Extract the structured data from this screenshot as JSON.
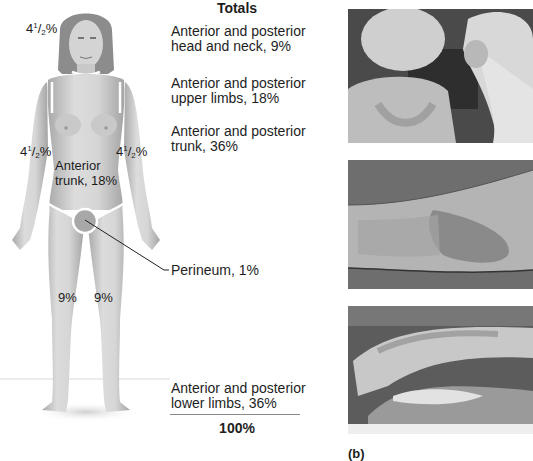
{
  "figure": {
    "labels": {
      "head_whole": "4",
      "head_num": "1",
      "head_den": "2",
      "head_pct": "%",
      "left_arm_whole": "4",
      "left_arm_num": "1",
      "left_arm_den": "2",
      "left_arm_pct": "%",
      "right_arm_whole": "4",
      "right_arm_num": "1",
      "right_arm_den": "2",
      "right_arm_pct": "%",
      "trunk_line1": "Anterior",
      "trunk_line2": "trunk, 18%",
      "left_leg": "9%",
      "right_leg": "9%",
      "perineum": "Perineum, 1%"
    }
  },
  "totals": {
    "title": "Totals",
    "rows": [
      {
        "line1": "Anterior and posterior",
        "line2": "head and neck, 9%"
      },
      {
        "line1": "Anterior and posterior",
        "line2": "upper limbs, 18%"
      },
      {
        "line1": "Anterior and posterior",
        "line2": "trunk, 36%"
      },
      {
        "line1": "Anterior and posterior",
        "line2": "lower limbs, 36%"
      }
    ],
    "sum": "100%"
  },
  "photos": [
    {
      "subject": "sunburned-back-photo"
    },
    {
      "subject": "burned-forearm-photo"
    },
    {
      "subject": "severe-burn-limbs-photo"
    }
  ],
  "panel_label": "(b)",
  "colors": {
    "skin_light": "#d8d8d8",
    "skin_shade": "#a8a8a8",
    "hair": "#8a8a8a",
    "outline_white": "#ffffff",
    "text": "#1e1e1e"
  }
}
